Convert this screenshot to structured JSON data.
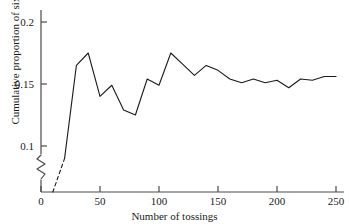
{
  "chart_data": {
    "type": "line",
    "title": "",
    "subtitle": "",
    "xlabel": "Number of tossings",
    "ylabel": "Cumulative proportion of sixes",
    "xlim": [
      0,
      250
    ],
    "ylim": [
      0.0,
      0.2
    ],
    "y_axis_break": true,
    "y_axis_break_note": "axis broken between 0 and 0.1",
    "grid": false,
    "legend": null,
    "xticks": [
      0,
      50,
      100,
      150,
      200,
      250
    ],
    "xtick_labels": [
      "0",
      "50",
      "100",
      "150",
      "200",
      "250"
    ],
    "yticks": [
      0.1,
      0.15,
      0.2
    ],
    "ytick_labels": [
      "0.1",
      "0.15",
      "0.2"
    ],
    "y_origin_label": "0",
    "line_color": "#1a1a1a",
    "line_width": 1.1,
    "dashed_start_segment": true,
    "series": [
      {
        "name": "Cumulative proportion of sixes",
        "x": [
          10,
          20,
          30,
          40,
          50,
          60,
          70,
          80,
          90,
          100,
          110,
          120,
          130,
          140,
          150,
          160,
          170,
          180,
          190,
          200,
          210,
          220,
          230,
          240,
          250
        ],
        "values": [
          0.0,
          0.09,
          0.165,
          0.175,
          0.14,
          0.149,
          0.129,
          0.125,
          0.154,
          0.149,
          0.175,
          0.166,
          0.157,
          0.165,
          0.161,
          0.154,
          0.151,
          0.154,
          0.151,
          0.153,
          0.147,
          0.154,
          0.153,
          0.156,
          0.156
        ]
      }
    ]
  },
  "axes": {
    "x_title": "Number of tossings",
    "y_title": "Cumulative proportion of sixes"
  }
}
